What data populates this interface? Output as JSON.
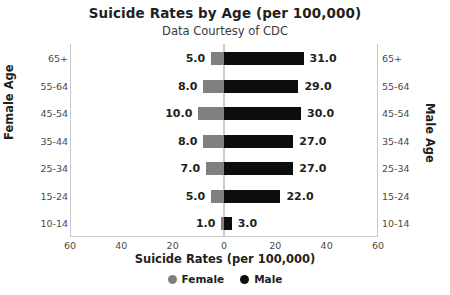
{
  "chart_data": {
    "type": "bar",
    "title": "Suicide Rates by Age (per 100,000)",
    "subtitle": "Data Courtesy of CDC",
    "xlabel": "Suicide Rates (per 100,000)",
    "ylabel_left": "Female Age",
    "ylabel_right": "Male Age",
    "orientation": "horizontal",
    "layout": "diverging-population-pyramid",
    "grid": false,
    "legend_position": "bottom",
    "xlim": [
      -60,
      60
    ],
    "xticks": [
      60,
      40,
      20,
      0,
      20,
      40,
      60
    ],
    "xtick_positions": [
      -60,
      -40,
      -20,
      0,
      20,
      40,
      60
    ],
    "categories": [
      "65+",
      "55-64",
      "45-54",
      "35-44",
      "25-34",
      "15-24",
      "10-14"
    ],
    "series": [
      {
        "name": "Female",
        "color": "#808080",
        "side": "left",
        "values": [
          5.0,
          8.0,
          10.0,
          8.0,
          7.0,
          5.0,
          1.0
        ],
        "labels": [
          "5.0",
          "8.0",
          "10.0",
          "8.0",
          "7.0",
          "5.0",
          "1.0"
        ]
      },
      {
        "name": "Male",
        "color": "#0d0d0d",
        "side": "right",
        "values": [
          31.0,
          29.0,
          30.0,
          27.0,
          27.0,
          22.0,
          3.0
        ],
        "labels": [
          "31.0",
          "29.0",
          "30.0",
          "27.0",
          "27.0",
          "22.0",
          "3.0"
        ]
      }
    ]
  },
  "legend": {
    "items": [
      {
        "label": "Female",
        "color": "#808080"
      },
      {
        "label": "Male",
        "color": "#0d0d0d"
      }
    ]
  }
}
